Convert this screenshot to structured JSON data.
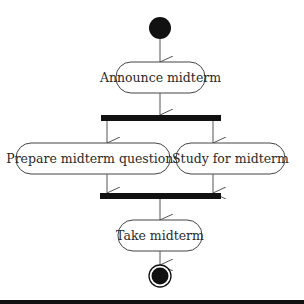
{
  "diagram": {
    "type": "uml-activity",
    "colors": {
      "line": "#555555",
      "bar": "#111111",
      "node_fill": "#111111",
      "background": "#ffffff"
    },
    "nodes": [
      {
        "id": "start",
        "kind": "initial"
      },
      {
        "id": "announce",
        "kind": "action",
        "label": "Announce midterm"
      },
      {
        "id": "fork",
        "kind": "fork"
      },
      {
        "id": "prepare",
        "kind": "action",
        "label": "Prepare midterm questions"
      },
      {
        "id": "study",
        "kind": "action",
        "label": "Study for midterm"
      },
      {
        "id": "join",
        "kind": "join"
      },
      {
        "id": "take",
        "kind": "action",
        "label": "Take midterm"
      },
      {
        "id": "end",
        "kind": "final"
      }
    ],
    "edges": [
      {
        "from": "start",
        "to": "announce"
      },
      {
        "from": "announce",
        "to": "fork"
      },
      {
        "from": "fork",
        "to": "prepare"
      },
      {
        "from": "fork",
        "to": "study"
      },
      {
        "from": "prepare",
        "to": "join"
      },
      {
        "from": "study",
        "to": "join"
      },
      {
        "from": "join",
        "to": "take"
      },
      {
        "from": "take",
        "to": "end"
      }
    ]
  }
}
